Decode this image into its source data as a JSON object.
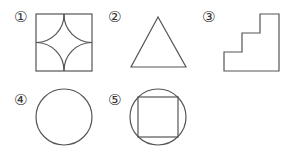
{
  "figure": {
    "stroke_color": "#555555",
    "background": "#ffffff",
    "items": [
      {
        "label": "①",
        "shape": "square with four inward quarter-circle arcs (astroid-like curved star)"
      },
      {
        "label": "②",
        "shape": "triangle"
      },
      {
        "label": "③",
        "shape": "staircase (three steps)"
      },
      {
        "label": "④",
        "shape": "circle"
      },
      {
        "label": "⑤",
        "shape": "circle with inscribed square"
      }
    ]
  }
}
